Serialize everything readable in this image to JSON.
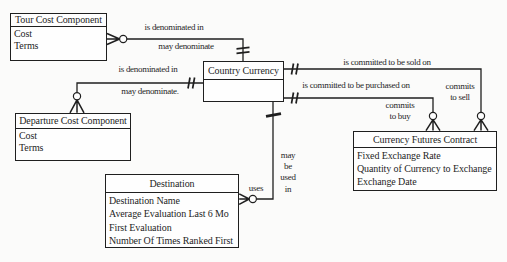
{
  "diagram": {
    "type": "er-diagram",
    "colors": {
      "ink": "#1f1f1f",
      "bg": "#fbfbfa",
      "fill": "#fefefe"
    },
    "entities": [
      {
        "name": "Tour Cost Component",
        "attributes": [
          "Cost",
          "Terms"
        ]
      },
      {
        "name": "Country Currency",
        "attributes": []
      },
      {
        "name": "Departure Cost Component",
        "attributes": [
          "Cost",
          "Terms"
        ]
      },
      {
        "name": "Destination",
        "attributes": [
          "Destination Name",
          "Average Evaluation Last 6 Mo",
          "First Evaluation",
          "Number Of Times Ranked First"
        ]
      },
      {
        "name": "Currency Futures Contract",
        "attributes": [
          "Fixed Exchange Rate",
          "Quantity of Currency to Exchange",
          "Exchange Date"
        ]
      }
    ],
    "relationships": [
      {
        "from": "Tour Cost Component",
        "to": "Country Currency",
        "forward_label": "is denominated in",
        "reverse_label": "may denominate",
        "from_cardinality": "optional-many",
        "to_cardinality": "exactly-one"
      },
      {
        "from": "Departure Cost Component",
        "to": "Country Currency",
        "forward_label": "is denominated in",
        "reverse_label": "may denominate.",
        "from_cardinality": "optional-many",
        "to_cardinality": "exactly-one"
      },
      {
        "from": "Country Currency",
        "to": "Currency Futures Contract",
        "forward_label": "is committed to be sold on",
        "reverse_label_lines": [
          "commits",
          "to sell"
        ],
        "from_cardinality": "exactly-one",
        "to_cardinality": "optional-many"
      },
      {
        "from": "Country Currency",
        "to": "Currency Futures Contract",
        "forward_label": "is committed to be purchased on",
        "reverse_label_lines": [
          "commits",
          "to buy"
        ],
        "from_cardinality": "exactly-one",
        "to_cardinality": "optional-many"
      },
      {
        "from": "Country Currency",
        "to": "Destination",
        "forward_label_lines": [
          "may",
          "be",
          "used",
          "in"
        ],
        "reverse_label": "uses",
        "from_cardinality": "one",
        "to_cardinality": "optional-many"
      }
    ]
  }
}
